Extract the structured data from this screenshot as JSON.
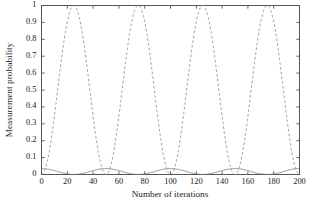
{
  "chart_data": {
    "type": "line",
    "title": "",
    "xlabel": "Number of iterations",
    "ylabel": "Measurement probability",
    "xlim": [
      0,
      200
    ],
    "ylim": [
      0,
      1
    ],
    "grid": false,
    "legend": "none",
    "xticks": [
      0,
      20,
      40,
      60,
      80,
      100,
      120,
      140,
      160,
      180,
      200
    ],
    "xtick_labels": [
      "0",
      "20",
      "40",
      "60",
      "80",
      "100",
      "120",
      "140",
      "160",
      "180",
      "200"
    ],
    "yticks": [
      0,
      0.1,
      0.2,
      0.3,
      0.4,
      0.5,
      0.6,
      0.7,
      0.8,
      0.9,
      1
    ],
    "ytick_labels": [
      "0",
      "0.1",
      "0.2",
      "0.3",
      "0.4",
      "0.5",
      "0.6",
      "0.7",
      "0.8",
      "0.9",
      "1"
    ],
    "series": [
      {
        "name": "oscillating-success-probability",
        "style": "dashed",
        "color": "#8c8c8c",
        "description": "sin-squared oscillation, period 50 iterations, peaks at 1.0",
        "model": {
          "form": "sin2",
          "amplitude": 1.0,
          "period": 50,
          "phase_peak": 25,
          "baseline": 0
        },
        "x": [
          0,
          5,
          10,
          15,
          20,
          25,
          30,
          35,
          40,
          45,
          50,
          55,
          60,
          65,
          70,
          75,
          80,
          85,
          90,
          95,
          100,
          105,
          110,
          115,
          120,
          125,
          130,
          135,
          140,
          145,
          150,
          155,
          160,
          165,
          170,
          175,
          180,
          185,
          190,
          195,
          200
        ],
        "y": [
          0,
          0.095,
          0.345,
          0.655,
          0.905,
          1,
          0.905,
          0.655,
          0.345,
          0.095,
          0,
          0.095,
          0.345,
          0.655,
          0.905,
          1,
          0.905,
          0.655,
          0.345,
          0.095,
          0,
          0.095,
          0.345,
          0.655,
          0.905,
          1,
          0.905,
          0.655,
          0.345,
          0.095,
          0,
          0.095,
          0.345,
          0.655,
          0.905,
          1,
          0.905,
          0.655,
          0.345,
          0.095,
          0
        ]
      },
      {
        "name": "low-amplitude-probability",
        "style": "solid",
        "color": "#707070",
        "description": "small-amplitude oscillation near zero, period 50 iterations, peaks about 0.035",
        "model": {
          "form": "cos2",
          "amplitude": 0.035,
          "period": 50,
          "phase_peak": 0,
          "baseline": 0
        },
        "x": [
          0,
          5,
          10,
          15,
          20,
          25,
          30,
          35,
          40,
          45,
          50,
          55,
          60,
          65,
          70,
          75,
          80,
          85,
          90,
          95,
          100,
          105,
          110,
          115,
          120,
          125,
          130,
          135,
          140,
          145,
          150,
          155,
          160,
          165,
          170,
          175,
          180,
          185,
          190,
          195,
          200
        ],
        "y": [
          0.035,
          0.032,
          0.023,
          0.012,
          0.003,
          0,
          0.003,
          0.012,
          0.023,
          0.032,
          0.035,
          0.032,
          0.023,
          0.012,
          0.003,
          0,
          0.003,
          0.012,
          0.023,
          0.032,
          0.035,
          0.032,
          0.023,
          0.012,
          0.003,
          0,
          0.003,
          0.012,
          0.023,
          0.032,
          0.035,
          0.032,
          0.023,
          0.012,
          0.003,
          0,
          0.003,
          0.012,
          0.023,
          0.032,
          0.035
        ]
      }
    ],
    "axes_color": "#555555"
  }
}
